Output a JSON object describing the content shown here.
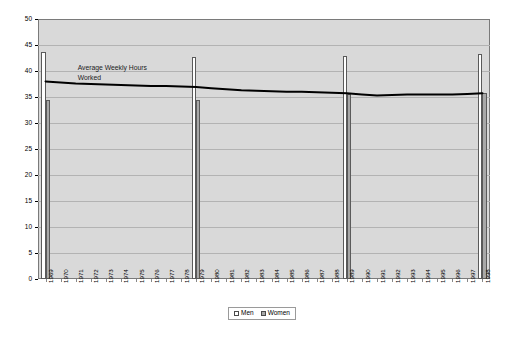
{
  "chart_data": {
    "type": "bar",
    "title": "",
    "subtitle": "",
    "xlabel": "",
    "ylabel": "",
    "ylim": [
      0,
      50
    ],
    "ytick_step": 5,
    "yticks": [
      0,
      5,
      10,
      15,
      20,
      25,
      30,
      35,
      40,
      45,
      50
    ],
    "grid": true,
    "legend_position": "bottom-center",
    "categories": [
      "1969",
      "1970",
      "1971",
      "1972",
      "1973",
      "1974",
      "1975",
      "1976",
      "1977",
      "1978",
      "1979",
      "1980",
      "1981",
      "1982",
      "1983",
      "1984",
      "1985",
      "1986",
      "1987",
      "1988",
      "1989",
      "1990",
      "1991",
      "1992",
      "1993",
      "1994",
      "1995",
      "1996",
      "1997",
      "1998"
    ],
    "series": [
      {
        "name": "Men",
        "color": "#ffffff",
        "type": "bar",
        "values": [
          43.7,
          null,
          null,
          null,
          null,
          null,
          null,
          null,
          null,
          null,
          42.7,
          null,
          null,
          null,
          null,
          null,
          null,
          null,
          null,
          null,
          42.8,
          null,
          null,
          null,
          null,
          null,
          null,
          null,
          null,
          43.3
        ]
      },
      {
        "name": "Women",
        "color": "#a8a8a8",
        "type": "bar",
        "values": [
          34.5,
          null,
          null,
          null,
          null,
          null,
          null,
          null,
          null,
          null,
          34.5,
          null,
          null,
          null,
          null,
          null,
          null,
          null,
          null,
          null,
          35.6,
          null,
          null,
          null,
          null,
          null,
          null,
          null,
          null,
          35.8
        ]
      },
      {
        "name": "Average Weekly Hours Worked",
        "color": "#000000",
        "type": "line",
        "values": [
          38.0,
          37.8,
          37.6,
          37.5,
          37.4,
          37.3,
          37.2,
          37.1,
          37.1,
          37.0,
          36.9,
          36.7,
          36.5,
          36.3,
          36.2,
          36.1,
          36.0,
          36.0,
          35.9,
          35.8,
          35.7,
          35.5,
          35.3,
          35.4,
          35.5,
          35.5,
          35.5,
          35.5,
          35.6,
          35.7
        ]
      }
    ],
    "annotations": [
      {
        "text": "Average Weekly Hours\nWorked",
        "x": "1971",
        "y": 40.5
      }
    ]
  },
  "legend": {
    "items": [
      {
        "label": "Men",
        "swatch": "white-square"
      },
      {
        "label": "Women",
        "swatch": "gray-square"
      }
    ]
  },
  "colors": {
    "plot_background": "#d9d9d9",
    "plot_border": "#7a7a7a",
    "gridline": "#b3b3b3",
    "men_bar": "#ffffff",
    "women_bar": "#a8a8a8",
    "bar_outline": "#5a5a5a",
    "line": "#000000",
    "text": "#000000",
    "page_background": "#ffffff"
  }
}
